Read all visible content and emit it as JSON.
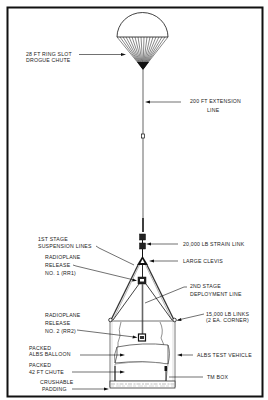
{
  "diagram": {
    "type": "parachute-drop-test-rig",
    "colors": {
      "ink": "#111111",
      "background": "#ffffff",
      "frame": "#111111"
    },
    "labels": {
      "drogue_chute": [
        "28 FT RING SLOT",
        "DROGUE CHUTE"
      ],
      "extension_line": [
        "200 FT EXTENSION",
        "LINE"
      ],
      "first_stage": [
        "1ST STAGE",
        "SUSPENSION LINES"
      ],
      "strain_link": [
        "20,000 LB STRAIN LINK"
      ],
      "rr1": [
        "RADIOPLANE",
        "RELEASE",
        "NO. 1 (RR1)"
      ],
      "clevis": [
        "LARGE CLEVIS"
      ],
      "second_stage": [
        "2ND STAGE",
        "DEPLOYMENT LINE"
      ],
      "rr2": [
        "RADIOPLANE",
        "RELEASE",
        "NO. 2 (RR2)"
      ],
      "links": [
        "15,000 LB LINKS",
        "(2 EA. CORNER)"
      ],
      "balloon": [
        "PACKED",
        "ALBS BALLOON"
      ],
      "test_vehicle": [
        "ALBS TEST VEHICLE"
      ],
      "chute42": [
        "PACKED",
        "42 FT CHUTE"
      ],
      "tm_box": [
        "TM BOX"
      ],
      "padding": [
        "CRUSHABLE",
        "PADDING"
      ]
    }
  }
}
